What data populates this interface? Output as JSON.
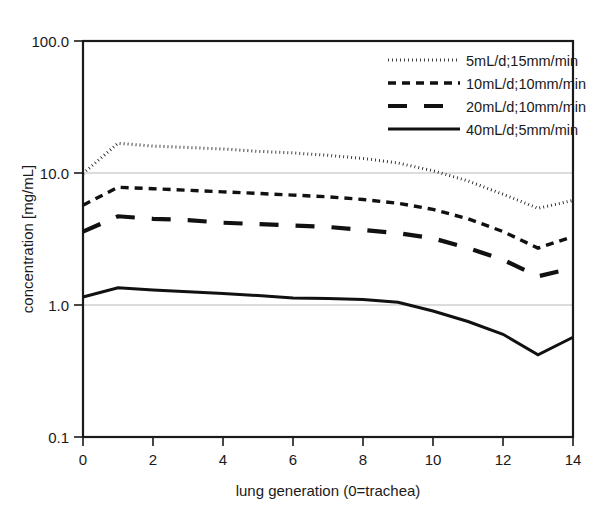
{
  "chart_data": {
    "type": "line",
    "title": "",
    "xlabel": "lung generation (0=trachea)",
    "ylabel": "concentration [mg/mL]",
    "yscale": "log",
    "xlim": [
      0,
      14
    ],
    "ylim": [
      0.1,
      100.0
    ],
    "x_ticks": [
      0,
      2,
      4,
      6,
      8,
      10,
      12,
      14
    ],
    "x_tick_labels": [
      "0",
      "2",
      "4",
      "6",
      "8",
      "10",
      "12",
      "14"
    ],
    "y_ticks": [
      0.1,
      1.0,
      10.0,
      100.0
    ],
    "y_tick_labels": [
      "0.1",
      "1.0",
      "10.0",
      "100.0"
    ],
    "grid": "horizontal-minor-at-1-and-10",
    "legend_position": "top-right",
    "x": [
      0,
      1,
      2,
      3,
      4,
      5,
      6,
      7,
      8,
      9,
      10,
      11,
      12,
      13,
      14
    ],
    "series": [
      {
        "name": "5mL/d;15mm/min",
        "style": "dotted",
        "values": [
          9.9,
          16.8,
          16.0,
          15.6,
          15.2,
          14.6,
          14.2,
          13.6,
          12.9,
          11.9,
          10.4,
          8.7,
          6.9,
          5.4,
          6.2
        ]
      },
      {
        "name": "10mL/d;10mm/min",
        "style": "dashed",
        "values": [
          5.7,
          7.8,
          7.6,
          7.4,
          7.2,
          7.0,
          6.8,
          6.6,
          6.3,
          5.9,
          5.3,
          4.5,
          3.6,
          2.7,
          3.3
        ]
      },
      {
        "name": "20mL/d;10mm/min",
        "style": "long-dash",
        "values": [
          3.6,
          4.7,
          4.5,
          4.4,
          4.2,
          4.1,
          4.0,
          3.9,
          3.7,
          3.5,
          3.2,
          2.7,
          2.2,
          1.65,
          1.9
        ]
      },
      {
        "name": "40mL/d;5mm/min",
        "style": "solid",
        "values": [
          1.15,
          1.35,
          1.3,
          1.26,
          1.22,
          1.18,
          1.13,
          1.12,
          1.1,
          1.05,
          0.9,
          0.75,
          0.6,
          0.42,
          0.57
        ]
      }
    ],
    "colors": {
      "series_line": "#111111",
      "axis": "#1a1a1a",
      "gridline": "#b9b9b9",
      "background": "#ffffff"
    }
  },
  "legend": {
    "entries": [
      {
        "label": "5mL/d;15mm/min"
      },
      {
        "label": "10mL/d;10mm/min"
      },
      {
        "label": "20mL/d;10mm/min"
      },
      {
        "label": "40mL/d;5mm/min"
      }
    ]
  },
  "axes": {
    "y_labels": [
      "100.0",
      "10.0",
      "1.0",
      "0.1"
    ],
    "x_labels": [
      "0",
      "2",
      "4",
      "6",
      "8",
      "10",
      "12",
      "14"
    ],
    "x_title": "lung generation (0=trachea)",
    "y_title": "concentration [mg/mL]"
  }
}
